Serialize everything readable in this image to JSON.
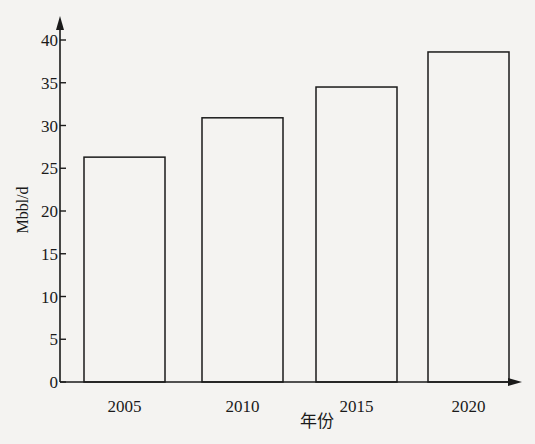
{
  "chart_data": {
    "type": "bar",
    "title": "",
    "xlabel": "年份",
    "ylabel": "Mbbl/d",
    "categories": [
      "2005",
      "2010",
      "2015",
      "2020"
    ],
    "values": [
      26.3,
      30.9,
      34.5,
      38.6
    ],
    "ylim": [
      0,
      40
    ],
    "yticks": [
      0,
      5,
      10,
      15,
      20,
      25,
      30,
      35,
      40
    ],
    "grid": false,
    "legend": null,
    "bar_fill": "#f4f3f1",
    "bar_stroke": "#1a1a1a"
  }
}
